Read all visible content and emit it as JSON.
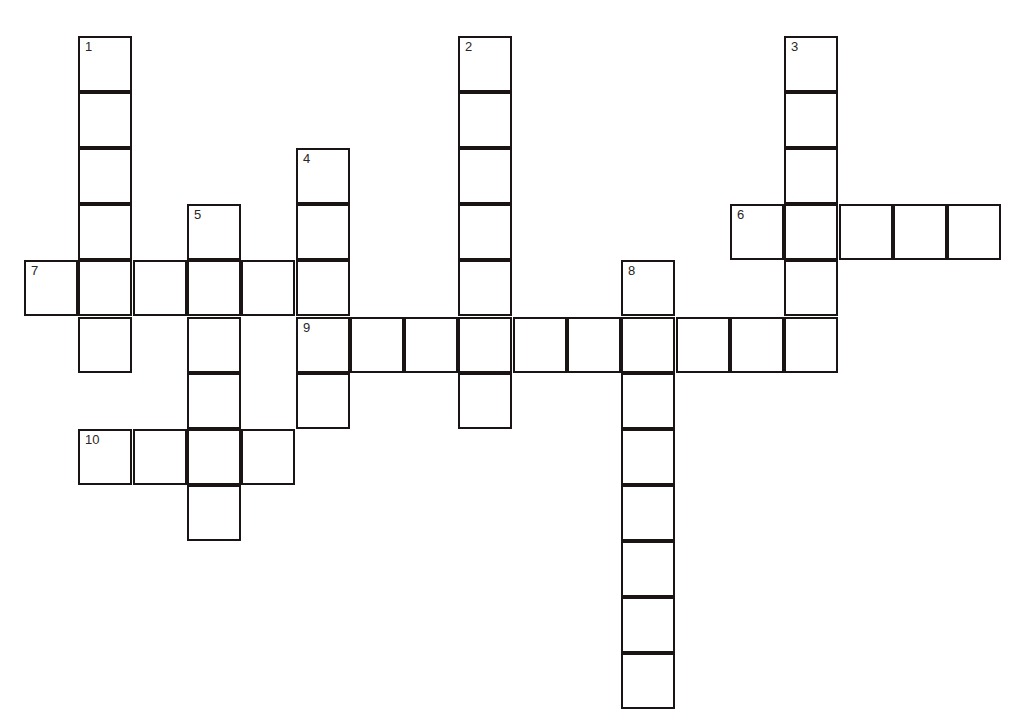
{
  "puzzle": {
    "type": "crossword",
    "grid_origin": {
      "x": 25,
      "y": 37
    },
    "cell_width": 54.3,
    "cell_height": 56.1,
    "line_color": "#1a1414",
    "clue_numbers": [
      {
        "num": "1",
        "col": 1,
        "row": 0,
        "direction": "down",
        "length": 6
      },
      {
        "num": "2",
        "col": 8,
        "row": 0,
        "direction": "down",
        "length": 7
      },
      {
        "num": "3",
        "col": 14,
        "row": 0,
        "direction": "down",
        "length": 6
      },
      {
        "num": "4",
        "col": 5,
        "row": 2,
        "direction": "down",
        "length": 5
      },
      {
        "num": "5",
        "col": 3,
        "row": 3,
        "direction": "down",
        "length": 6
      },
      {
        "num": "6",
        "col": 13,
        "row": 3,
        "direction": "across",
        "length": 5
      },
      {
        "num": "7",
        "col": 0,
        "row": 4,
        "direction": "across",
        "length": 6
      },
      {
        "num": "8",
        "col": 11,
        "row": 4,
        "direction": "down",
        "length": 8
      },
      {
        "num": "9",
        "col": 5,
        "row": 5,
        "direction": "across",
        "length": 10
      },
      {
        "num": "10",
        "col": 1,
        "row": 7,
        "direction": "across",
        "length": 4
      }
    ]
  }
}
